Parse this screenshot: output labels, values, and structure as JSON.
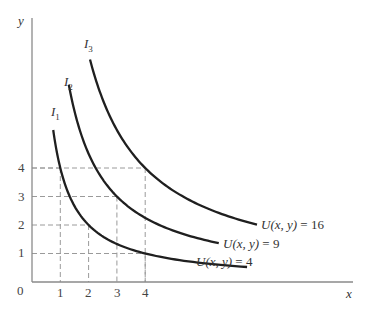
{
  "chart_data": {
    "type": "line",
    "title": "",
    "xlabel": "x",
    "ylabel": "y",
    "origin_label": "0",
    "xlim": [
      0,
      11
    ],
    "ylim": [
      0,
      9.3
    ],
    "grid": false,
    "x_ticks": [
      "1",
      "2",
      "3",
      "4"
    ],
    "y_ticks": [
      "1",
      "2",
      "3",
      "4"
    ],
    "reference_lines": [
      {
        "x": 1,
        "y": 4
      },
      {
        "x": 2,
        "y": 2
      },
      {
        "x": 3,
        "y": 3
      },
      {
        "x": 4,
        "y": 1
      },
      {
        "x": 4,
        "y": 4
      }
    ],
    "series": [
      {
        "name": "I1",
        "label": "U(x, y) = 4",
        "utility": 4,
        "x_range": [
          0.75,
          7.6
        ]
      },
      {
        "name": "I2",
        "label": "U(x, y) = 9",
        "utility": 9,
        "x_range": [
          1.3,
          6.6
        ]
      },
      {
        "name": "I3",
        "label": "U(x, y) = 16",
        "utility": 16,
        "x_range": [
          2.05,
          7.95
        ]
      }
    ],
    "legend": "inline labels at curve ends"
  },
  "labels": {
    "x_axis": "x",
    "y_axis": "y",
    "origin": "0",
    "curve_names": [
      {
        "main": "I",
        "sub": "1"
      },
      {
        "main": "I",
        "sub": "2"
      },
      {
        "main": "I",
        "sub": "3"
      }
    ],
    "curve_end_labels": [
      {
        "fn": "U(x, y)",
        "eq": " = 4"
      },
      {
        "fn": "U(x, y)",
        "eq": " = 9"
      },
      {
        "fn": "U(x, y)",
        "eq": " = 16"
      }
    ],
    "x_ticks": [
      "1",
      "2",
      "3",
      "4"
    ],
    "y_ticks": [
      "1",
      "2",
      "3",
      "4"
    ]
  }
}
